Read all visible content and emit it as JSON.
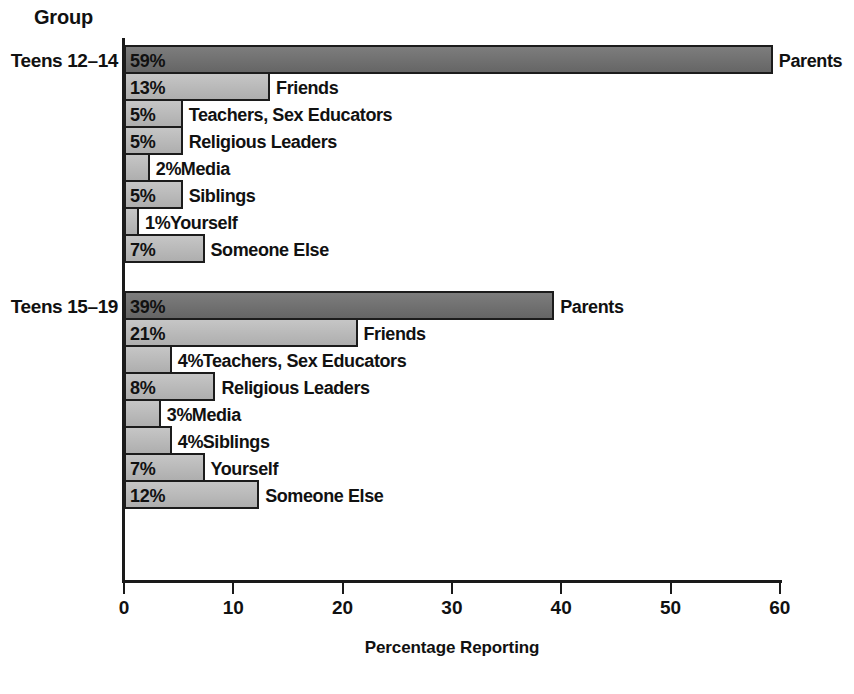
{
  "axis_label_header": "Group",
  "chart_data": {
    "type": "bar",
    "orientation": "horizontal",
    "title": "",
    "xlabel": "Percentage Reporting",
    "ylabel": "Group",
    "xlim": [
      0,
      60
    ],
    "xticks": [
      0,
      10,
      20,
      30,
      40,
      50,
      60
    ],
    "xtick_labels": [
      "0",
      "10",
      "20",
      "30",
      "40",
      "50",
      "60"
    ],
    "grid": false,
    "legend": "none",
    "value_suffix": "%",
    "colors": {
      "bar_light": "#b9b9b9",
      "bar_dark": "#6e6e6e",
      "bar_border": "#1c1c1c",
      "axis": "#1a1a1a",
      "text": "#111111",
      "background": "#ffffff"
    },
    "groups": [
      {
        "label": "Teens 12–14",
        "categories": [
          "Parents",
          "Friends",
          "Teachers, Sex Educators",
          "Religious Leaders",
          "Media",
          "Siblings",
          "Yourself",
          "Someone Else"
        ],
        "values": [
          59,
          13,
          5,
          5,
          2,
          5,
          1,
          7
        ],
        "value_labels": [
          "59%",
          "13%",
          "5%",
          "5%",
          "2%",
          "5%",
          "1%",
          "7%"
        ],
        "shades": [
          "dark",
          "light",
          "light",
          "light",
          "light",
          "light",
          "light",
          "light"
        ]
      },
      {
        "label": "Teens 15–19",
        "categories": [
          "Parents",
          "Friends",
          "Teachers, Sex Educators",
          "Religious Leaders",
          "Media",
          "Siblings",
          "Yourself",
          "Someone Else"
        ],
        "values": [
          39,
          21,
          4,
          8,
          3,
          4,
          7,
          12
        ],
        "value_labels": [
          "39%",
          "21%",
          "4%",
          "8%",
          "3%",
          "4%",
          "7%",
          "12%"
        ],
        "shades": [
          "dark",
          "light",
          "light",
          "light",
          "light",
          "light",
          "light",
          "light"
        ]
      }
    ]
  }
}
